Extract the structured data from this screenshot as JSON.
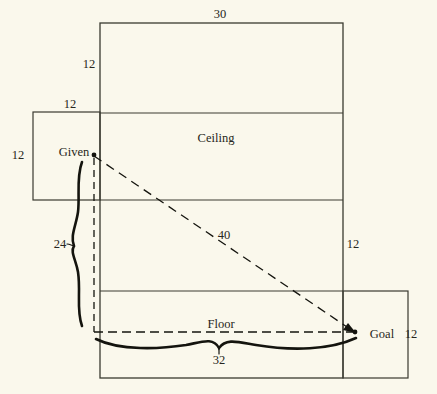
{
  "figure": {
    "background_color": "#faf8ec",
    "line_color": "#3a3a30",
    "text_color": "#262620"
  },
  "labels": {
    "top_width": "30",
    "upper_left_height": "12",
    "left_flap_width": "12",
    "left_flap_height": "12",
    "brace_left": "24",
    "right_height": "12",
    "diagonal": "40",
    "brace_bottom": "32",
    "bottom_right_height": "12",
    "ceiling": "Ceiling",
    "floor": "Floor",
    "given": "Given",
    "goal": "Goal"
  },
  "geometry": {
    "main_rect": {
      "x1": 100,
      "y1": 23,
      "x2": 343,
      "y2": 378
    },
    "left_rect": {
      "x1": 33,
      "y1": 112,
      "x2": 100,
      "y2": 200
    },
    "bottom_right_rect": {
      "x1": 343,
      "y1": 291,
      "x2": 408,
      "y2": 378
    },
    "divider_ceiling_top_y": 113,
    "divider_ceiling_bottom_y": 200,
    "divider_floor_top_y": 291,
    "given_point": {
      "x": 94,
      "y": 155
    },
    "goal_point": {
      "x": 355,
      "y": 332
    },
    "dashed_corner": {
      "x": 94,
      "y": 332
    }
  },
  "label_positions": {
    "top_width": {
      "x": 220,
      "y": 14
    },
    "upper_left_height": {
      "x": 89,
      "y": 64
    },
    "left_flap_width": {
      "x": 70,
      "y": 104
    },
    "left_flap_height": {
      "x": 18,
      "y": 155
    },
    "brace_left": {
      "x": 60,
      "y": 244
    },
    "right_height": {
      "x": 353,
      "y": 244
    },
    "diagonal": {
      "x": 224,
      "y": 235
    },
    "brace_bottom": {
      "x": 219,
      "y": 360
    },
    "bottom_right_height": {
      "x": 411,
      "y": 334
    },
    "ceiling": {
      "x": 216,
      "y": 138
    },
    "floor": {
      "x": 221,
      "y": 324
    },
    "given": {
      "x": 74,
      "y": 152
    },
    "goal": {
      "x": 382,
      "y": 334
    }
  }
}
